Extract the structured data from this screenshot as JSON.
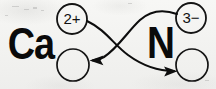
{
  "diagram": {
    "type": "ionic-electron-transfer",
    "background_color": "#f4f4f2",
    "ink_color": "#0a0a0a",
    "elements": [
      {
        "id": "calcium",
        "symbol": "Ca",
        "x": 31,
        "y": 47,
        "font_size": 44
      },
      {
        "id": "nitrogen",
        "symbol": "N",
        "x": 161,
        "y": 46,
        "font_size": 44
      }
    ],
    "charge_circles": [
      {
        "id": "ca-charge",
        "label": "2+",
        "cx": 72,
        "cy": 19,
        "r": 15,
        "font_size": 15,
        "filled": false
      },
      {
        "id": "ca-empty",
        "label": "",
        "cx": 73,
        "cy": 65,
        "r": 16,
        "font_size": 15,
        "filled": false
      },
      {
        "id": "n-charge",
        "label": "3−",
        "cx": 191,
        "cy": 18,
        "r": 15,
        "font_size": 15,
        "filled": false
      },
      {
        "id": "n-empty",
        "label": "",
        "cx": 192,
        "cy": 65,
        "r": 16,
        "font_size": 15,
        "filled": false
      }
    ],
    "arrows": [
      {
        "id": "arrow-ca-to-n",
        "from": "ca-charge",
        "to": "n-empty",
        "path": "M 87 21 C 106 30 113 44 128 55 C 143 66 160 71 174 71",
        "arrowhead_at": [
          176,
          71
        ],
        "arrowhead_angle": 6,
        "stroke_width": 2.1
      },
      {
        "id": "arrow-n-to-ca",
        "from": "n-charge",
        "to": "ca-empty",
        "path": "M 177 14 C 163 9 150 11 140 20 C 128 31 118 48 104 57 C 100 59 96 60 93 60",
        "arrowhead_at": [
          90,
          60
        ],
        "arrowhead_angle": 186,
        "stroke_width": 2.1
      }
    ]
  }
}
